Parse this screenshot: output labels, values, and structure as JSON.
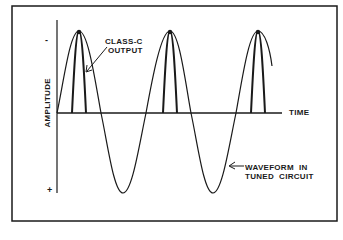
{
  "diagram": {
    "labels": {
      "class_c_line1": "CLASS-C",
      "class_c_line2": "OUTPUT",
      "time": "TIME",
      "waveform_line1": "WAVEFORM  IN",
      "waveform_line2": "TUNED  CIRCUIT",
      "amplitude": "AMPLITUDE",
      "minus": "-",
      "plus": "+"
    },
    "axes": {
      "y_axis_label": "AMPLITUDE",
      "x_axis_label": "TIME",
      "y_top_marker": "-",
      "y_bottom_marker": "+"
    },
    "waveform": {
      "type": "sine",
      "cycles_shown": 2.75,
      "peaks": 3,
      "troughs": 2
    },
    "class_c_pulses": {
      "count": 3,
      "description": "narrow pulses at each positive peak of the tuned-circuit waveform"
    },
    "colors": {
      "line": "#1a1a1a",
      "background": "#ffffff"
    }
  }
}
